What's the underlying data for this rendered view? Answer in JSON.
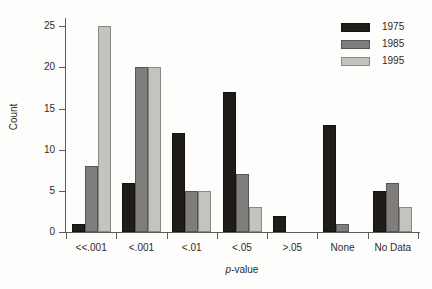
{
  "chart_data": {
    "type": "bar",
    "title": "",
    "subtitle": "",
    "xlabel": "p-value",
    "xlabel_italic_prefix": "p",
    "xlabel_rest": "-value",
    "ylabel": "Count",
    "categories": [
      "<<.001",
      "<.001",
      "<.01",
      "<.05",
      ">.05",
      "None",
      "No Data"
    ],
    "series": [
      {
        "name": "1975",
        "color": "#1f1c1a",
        "values": [
          1,
          6,
          12,
          17,
          2,
          13,
          5
        ]
      },
      {
        "name": "1985",
        "color": "#807e7c",
        "values": [
          8,
          20,
          5,
          7,
          0,
          1,
          6
        ]
      },
      {
        "name": "1995",
        "color": "#c4c3c0",
        "values": [
          25,
          20,
          5,
          3,
          0,
          0,
          3
        ]
      }
    ],
    "ylim": [
      0,
      26
    ],
    "yticks": [
      0,
      5,
      10,
      15,
      20,
      25
    ],
    "ytick_labels": [
      "0",
      "5",
      "10",
      "15",
      "20",
      "25"
    ],
    "grid": false,
    "legend_position": "top-right",
    "legend_entries": [
      "1975",
      "1985",
      "1995"
    ]
  }
}
